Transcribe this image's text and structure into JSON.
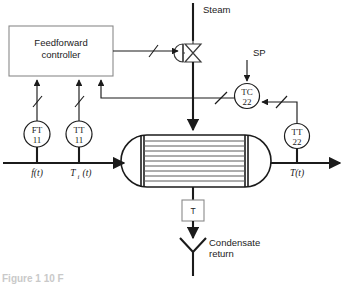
{
  "diagram": {
    "caption_partial": "Figure 1 10 F",
    "colors": {
      "line": "#1b1b1b",
      "tube": "#5a5a5a",
      "box_outline": "#8a8a8a",
      "background": "#ffffff"
    },
    "labels": {
      "steam": "Steam",
      "setpoint": "SP",
      "condensate_line1": "Condensate",
      "condensate_line2": "return",
      "controller_line1": "Feedforward",
      "controller_line2": "controller",
      "trap": "T",
      "inlet_flow": "f(t)",
      "inlet_temp_base": "T",
      "inlet_temp_sub": "i",
      "inlet_temp_arg": "(t)",
      "outlet_temp": "T(t)"
    },
    "instruments": [
      {
        "name": "flow-transmitter",
        "tag_top": "FT",
        "tag_bottom": "11",
        "cx": 37,
        "cy": 134,
        "r": 13
      },
      {
        "name": "inlet-temperature-transmitter",
        "tag_top": "TT",
        "tag_bottom": "11",
        "cx": 79,
        "cy": 134,
        "r": 13
      },
      {
        "name": "temperature-controller",
        "tag_top": "TC",
        "tag_bottom": "22",
        "cx": 247,
        "cy": 96,
        "r": 12.5
      },
      {
        "name": "outlet-temperature-transmitter",
        "tag_top": "TT",
        "tag_bottom": "22",
        "cx": 297,
        "cy": 136,
        "r": 12.5
      }
    ],
    "exchanger": {
      "name": "heat-exchanger",
      "left": 120,
      "right": 272,
      "top": 135,
      "bottom": 187,
      "tube_count": 9,
      "tubesheet_left": 141,
      "tubesheet_right": 247
    },
    "valve": {
      "name": "steam-control-valve",
      "cx": 193,
      "cy": 53
    }
  },
  "signal_marks": [
    {
      "name": "signal-slash-ft",
      "x": 37,
      "y": 102
    },
    {
      "name": "signal-slash-tt11",
      "x": 79,
      "y": 102
    },
    {
      "name": "signal-slash-valve",
      "x": 153,
      "y": 53
    },
    {
      "name": "signal-slash-tc-left",
      "x": 222,
      "y": 101
    },
    {
      "name": "signal-slash-tc-right",
      "x": 275,
      "y": 96
    }
  ]
}
